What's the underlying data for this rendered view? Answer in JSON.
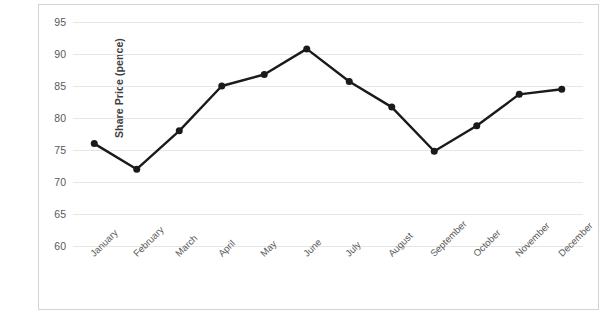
{
  "chart_data": {
    "type": "line",
    "title": "",
    "subtitle": "",
    "xlabel": "",
    "ylabel": "Share Price (pence)",
    "categories": [
      "January",
      "February",
      "March",
      "April",
      "May",
      "June",
      "July",
      "August",
      "September",
      "October",
      "November",
      "December"
    ],
    "values": [
      76.0,
      72.0,
      78.0,
      85.0,
      86.8,
      90.8,
      85.7,
      81.7,
      74.8,
      78.8,
      83.7,
      84.5
    ],
    "series": [
      {
        "name": "Share Price",
        "values": [
          76.0,
          72.0,
          78.0,
          85.0,
          86.8,
          90.8,
          85.7,
          81.7,
          74.8,
          78.8,
          83.7,
          84.5
        ]
      }
    ],
    "ylim": [
      60,
      95
    ],
    "yticks": [
      95,
      90,
      85,
      80,
      75,
      70,
      65,
      60
    ],
    "ytick_labels": [
      "95",
      "90",
      "85",
      "80",
      "75",
      "70",
      "65",
      "60"
    ],
    "grid": "horizontal-only",
    "legend": "none",
    "marker": "filled-circle",
    "line_color": "#1a1a1a",
    "marker_color": "#1a1a1a",
    "grid_color": "#e6e6e6",
    "frame_color": "#d4d4d4",
    "xtick_rotation": -45
  },
  "footer": {
    "page_number": ""
  }
}
